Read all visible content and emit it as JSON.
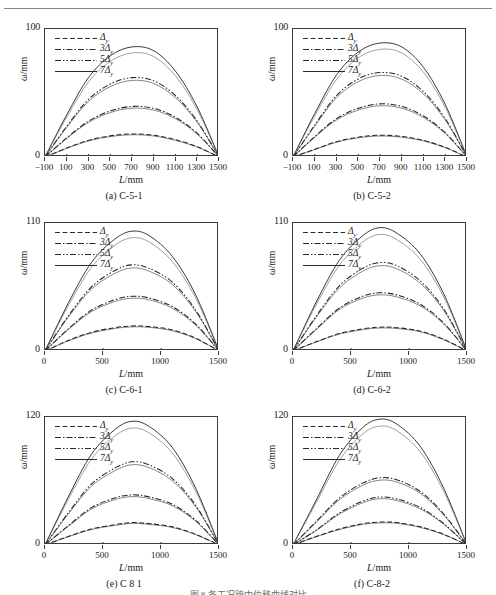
{
  "figure": {
    "bottom_caption": "图 8 各工况跨中位移曲线对比",
    "legend_labels": [
      "Δy",
      "3Δy",
      "5Δy",
      "7Δy"
    ],
    "legend_styles": [
      "dashed",
      "dash-dot",
      "dash-dot-dot",
      "solid"
    ],
    "y_axis_label": "ω/mm",
    "x_axis_label": "L/mm"
  },
  "chart_data": [
    {
      "type": "line",
      "panel": "a",
      "title": "(a) C-5-1",
      "xlabel": "L/mm",
      "ylabel": "ω/mm",
      "xlim": [
        -100,
        1500
      ],
      "ylim": [
        0,
        100
      ],
      "xticks": [
        -100,
        100,
        300,
        500,
        700,
        900,
        1100,
        1300,
        1500
      ],
      "yticks": [
        0,
        100
      ],
      "grid": false,
      "legend_position": "top-left",
      "x": [
        -100,
        100,
        300,
        500,
        700,
        900,
        1100,
        1300,
        1500
      ],
      "series": [
        {
          "name": "Δy",
          "style": "dashed",
          "values": [
            0,
            7,
            13,
            16.5,
            18,
            17,
            13.5,
            8,
            0
          ]
        },
        {
          "name": "3Δy",
          "style": "dash-dot",
          "values": [
            0,
            15,
            28,
            36,
            39.5,
            38,
            31,
            18.5,
            0
          ]
        },
        {
          "name": "5Δy",
          "style": "dash-dot-dot",
          "values": [
            0,
            24,
            45,
            57,
            62,
            59.5,
            48,
            28,
            0
          ]
        },
        {
          "name": "7Δy",
          "style": "solid",
          "values": [
            0,
            33,
            62,
            79,
            86,
            83,
            67,
            39,
            0
          ]
        }
      ]
    },
    {
      "type": "line",
      "panel": "b",
      "title": "(b) C-5-2",
      "xlabel": "L/mm",
      "ylabel": "ω/mm",
      "xlim": [
        -100,
        1500
      ],
      "ylim": [
        0,
        100
      ],
      "xticks": [
        -100,
        100,
        300,
        500,
        700,
        900,
        1100,
        1300,
        1500
      ],
      "yticks": [
        0,
        100
      ],
      "grid": false,
      "legend_position": "top-left",
      "x": [
        -100,
        100,
        300,
        500,
        700,
        900,
        1100,
        1300,
        1500
      ],
      "series": [
        {
          "name": "Δy",
          "style": "dashed",
          "values": [
            0,
            6,
            12,
            15.5,
            17,
            16,
            13,
            7.5,
            0
          ]
        },
        {
          "name": "3Δy",
          "style": "dash-dot",
          "values": [
            0,
            16,
            30,
            38,
            41.5,
            39.5,
            32,
            19,
            0
          ]
        },
        {
          "name": "5Δy",
          "style": "dash-dot-dot",
          "values": [
            0,
            25,
            48,
            61,
            66,
            63,
            51,
            30,
            0
          ]
        },
        {
          "name": "7Δy",
          "style": "solid",
          "values": [
            0,
            34,
            64,
            82,
            89,
            86,
            70,
            41,
            0
          ]
        }
      ]
    },
    {
      "type": "line",
      "panel": "c",
      "title": "(c) C-6-1",
      "xlabel": "L/mm",
      "ylabel": "ω/mm",
      "xlim": [
        0,
        1500
      ],
      "ylim": [
        0,
        110
      ],
      "xticks": [
        0,
        500,
        1000,
        1500
      ],
      "yticks": [
        0,
        110
      ],
      "grid": false,
      "legend_position": "top-left",
      "x": [
        0,
        200,
        400,
        600,
        750,
        900,
        1100,
        1300,
        1500
      ],
      "series": [
        {
          "name": "Δy",
          "style": "dashed",
          "values": [
            0,
            9,
            16,
            20,
            21.5,
            21,
            18,
            11,
            0
          ]
        },
        {
          "name": "3Δy",
          "style": "dash-dot",
          "values": [
            0,
            19,
            35,
            44,
            47,
            45.5,
            38,
            23,
            0
          ]
        },
        {
          "name": "5Δy",
          "style": "dash-dot-dot",
          "values": [
            0,
            30,
            55,
            69,
            74,
            71,
            59,
            35,
            0
          ]
        },
        {
          "name": "7Δy",
          "style": "solid",
          "values": [
            0,
            41,
            76,
            96,
            103,
            99,
            81,
            48,
            0
          ]
        }
      ]
    },
    {
      "type": "line",
      "panel": "d",
      "title": "(d) C-6-2",
      "xlabel": "L/mm",
      "ylabel": "ω/mm",
      "xlim": [
        0,
        1500
      ],
      "ylim": [
        0,
        110
      ],
      "xticks": [
        0,
        500,
        1000,
        1500
      ],
      "yticks": [
        0,
        110
      ],
      "grid": false,
      "legend_position": "top-left",
      "x": [
        0,
        200,
        400,
        600,
        750,
        900,
        1100,
        1300,
        1500
      ],
      "series": [
        {
          "name": "Δy",
          "style": "dashed",
          "values": [
            0,
            8,
            15,
            19,
            20.5,
            20,
            17,
            10,
            0
          ]
        },
        {
          "name": "3Δy",
          "style": "dash-dot",
          "values": [
            0,
            19,
            37,
            47,
            50,
            48,
            40,
            24,
            0
          ]
        },
        {
          "name": "5Δy",
          "style": "dash-dot-dot",
          "values": [
            0,
            30,
            56,
            71,
            76,
            73,
            60,
            36,
            0
          ]
        },
        {
          "name": "7Δy",
          "style": "solid",
          "values": [
            0,
            42,
            78,
            99,
            106,
            101,
            83,
            49,
            0
          ]
        }
      ]
    },
    {
      "type": "line",
      "panel": "e",
      "title": "(e) C 8 1",
      "xlabel": "L/mm",
      "ylabel": "ω/mm",
      "xlim": [
        0,
        1500
      ],
      "ylim": [
        0,
        120
      ],
      "xticks": [
        0,
        500,
        1000,
        1500
      ],
      "yticks": [
        0,
        120
      ],
      "grid": false,
      "legend_position": "top-left",
      "x": [
        0,
        200,
        400,
        600,
        750,
        900,
        1100,
        1300,
        1500
      ],
      "series": [
        {
          "name": "Δy",
          "style": "dashed",
          "values": [
            0,
            8,
            15,
            19,
            21,
            20,
            17,
            10,
            0
          ]
        },
        {
          "name": "3Δy",
          "style": "dash-dot",
          "values": [
            0,
            18,
            35,
            44,
            47,
            45,
            38,
            23,
            0
          ]
        },
        {
          "name": "5Δy",
          "style": "dash-dot-dot",
          "values": [
            0,
            30,
            57,
            72,
            78,
            75,
            62,
            37,
            0
          ]
        },
        {
          "name": "7Δy",
          "style": "solid",
          "values": [
            0,
            45,
            85,
            108,
            116,
            111,
            91,
            53,
            0
          ]
        }
      ]
    },
    {
      "type": "line",
      "panel": "f",
      "title": "(f) C-8-2",
      "xlabel": "L/mm",
      "ylabel": "ω/mm",
      "xlim": [
        0,
        1500
      ],
      "ylim": [
        0,
        120
      ],
      "xticks": [
        0,
        500,
        1000,
        1500
      ],
      "yticks": [
        0,
        120
      ],
      "grid": false,
      "legend_position": "top-left",
      "x": [
        0,
        200,
        400,
        600,
        750,
        900,
        1100,
        1300,
        1500
      ],
      "series": [
        {
          "name": "Δy",
          "style": "dashed",
          "values": [
            0,
            8,
            15,
            20,
            21.5,
            21,
            17,
            10,
            0
          ]
        },
        {
          "name": "3Δy",
          "style": "dash-dot",
          "values": [
            0,
            22,
            44,
            58,
            63,
            61,
            50,
            29,
            0
          ]
        },
        {
          "name": "5Δy",
          "style": "dash-dot-dot",
          "values": [
            0,
            14,
            30,
            41,
            45,
            43,
            35,
            20,
            0
          ]
        },
        {
          "name": "7Δy",
          "style": "solid",
          "values": [
            0,
            42,
            84,
            110,
            118,
            113,
            92,
            53,
            0
          ]
        }
      ]
    }
  ]
}
